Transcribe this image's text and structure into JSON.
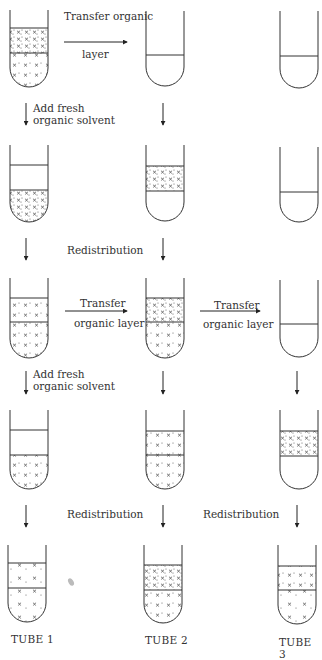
{
  "diagram": {
    "type": "liquid-liquid extraction (countercurrent distribution)",
    "tube_labels": [
      "TUBE 1",
      "TUBE 2",
      "TUBE 3"
    ],
    "step_labels": {
      "transfer_organic_layer_row1_line1": "Transfer organic",
      "transfer_organic_layer_row1_line2": "layer",
      "add_fresh_row1_line1": "Add fresh",
      "add_fresh_row1_line2": "organic solvent",
      "redistribution_row2": "Redistribution",
      "transfer_row3a_line1": "Transfer",
      "transfer_row3a_line2": "organic layer",
      "transfer_row3b_line1": "Transfer",
      "transfer_row3b_line2": "organic layer",
      "add_fresh_row3_line1": "Add fresh",
      "add_fresh_row3_line2": "organic solvent",
      "redistribution_row4a": "Redistribution",
      "redistribution_row4b": "Redistribution"
    },
    "rows": [
      {
        "step": 1,
        "tubes": [
          "both layers with solute",
          "lower layer only (empty)",
          "lower layer only (empty)"
        ]
      },
      {
        "step": 2,
        "tubes": [
          "fresh upper, solute in lower",
          "organic layer with solute (upper), empty lower",
          "lower layer only (empty)"
        ]
      },
      {
        "step": 3,
        "tubes": [
          "solute in both layers",
          "solute in both layers",
          "lower layer only (empty)"
        ]
      },
      {
        "step": 4,
        "tubes": [
          "fresh upper, solute in lower",
          "solute in both layers",
          "organic layer with solute (upper), empty lower"
        ]
      },
      {
        "step": 5,
        "tubes": [
          "solute in both layers (sparse)",
          "solute in both layers (dense)",
          "solute in both layers"
        ]
      }
    ]
  }
}
